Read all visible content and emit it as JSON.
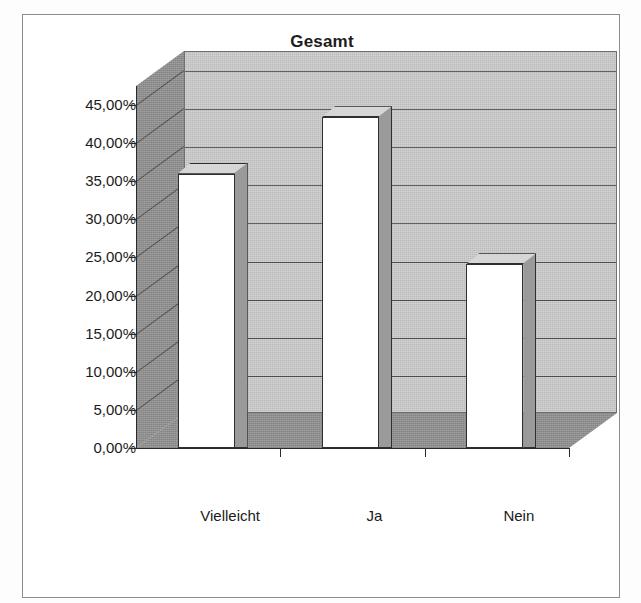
{
  "chart_data": {
    "type": "bar",
    "title": "Gesamt",
    "subtitle": "",
    "xlabel": "",
    "ylabel": "",
    "categories": [
      "Vielleicht",
      "Ja",
      "Nein"
    ],
    "values": [
      36.0,
      43.4,
      24.1
    ],
    "value_labels": [
      "36,00%",
      "43,40%",
      "24,10%"
    ],
    "ylim": [
      0,
      47.5
    ],
    "ytick_values": [
      0,
      5,
      10,
      15,
      20,
      25,
      30,
      35,
      40,
      45
    ],
    "ytick_labels": [
      "0,00%",
      "5,00%",
      "10,00%",
      "15,00%",
      "20,00%",
      "25,00%",
      "30,00%",
      "35,00%",
      "40,00%",
      "45,00%"
    ],
    "grid": true,
    "grid_axis": "y",
    "legend": false,
    "legend_position": "none",
    "style": "3d-column",
    "series": [
      {
        "name": "Gesamt",
        "values": [
          36.0,
          43.4,
          24.1
        ]
      }
    ],
    "annotations": []
  },
  "colors": {
    "bar_front": "#ffffff",
    "bar_side": "#9a9a9a",
    "bar_top": "#d6d6d6",
    "back_wall": "#c9c9c9",
    "side_wall": "#8c8c8c",
    "floor": "#8c8c8c",
    "gridline": "#4a4a4a",
    "axis": "#2b2b2b",
    "text": "#1b1b1b",
    "frame": "#8d8d8d",
    "background": "#ffffff"
  },
  "icons": {
    "none": ""
  }
}
